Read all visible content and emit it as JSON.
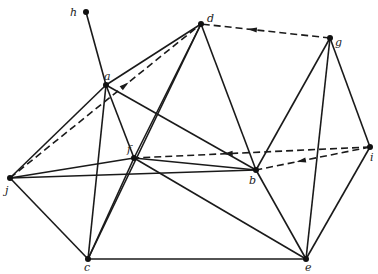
{
  "diagram": {
    "type": "graph",
    "nodes": [
      {
        "id": "h",
        "label": "h",
        "x": 86,
        "y": 12,
        "lx": 70,
        "ly": 16
      },
      {
        "id": "a",
        "label": "a",
        "x": 106,
        "y": 85,
        "lx": 104,
        "ly": 80
      },
      {
        "id": "d",
        "label": "d",
        "x": 201,
        "y": 24,
        "lx": 207,
        "ly": 22
      },
      {
        "id": "g",
        "label": "g",
        "x": 330,
        "y": 38,
        "lx": 335,
        "ly": 46
      },
      {
        "id": "f",
        "label": "f",
        "x": 134,
        "y": 158,
        "lx": 127,
        "ly": 153
      },
      {
        "id": "b",
        "label": "b",
        "x": 256,
        "y": 170,
        "lx": 249,
        "ly": 184
      },
      {
        "id": "i",
        "label": "i",
        "x": 370,
        "y": 147,
        "lx": 370,
        "ly": 161
      },
      {
        "id": "j",
        "label": "j",
        "x": 10,
        "y": 178,
        "lx": 5,
        "ly": 194
      },
      {
        "id": "c",
        "label": "c",
        "x": 88,
        "y": 259,
        "lx": 84,
        "ly": 271
      },
      {
        "id": "e",
        "label": "e",
        "x": 306,
        "y": 259,
        "lx": 305,
        "ly": 271
      }
    ],
    "edges": [
      {
        "from": "h",
        "to": "a"
      },
      {
        "from": "a",
        "to": "d"
      },
      {
        "from": "a",
        "to": "j"
      },
      {
        "from": "a",
        "to": "c"
      },
      {
        "from": "a",
        "to": "f"
      },
      {
        "from": "a",
        "to": "b"
      },
      {
        "from": "d",
        "to": "f"
      },
      {
        "from": "d",
        "to": "b"
      },
      {
        "from": "d",
        "to": "c"
      },
      {
        "from": "g",
        "to": "b"
      },
      {
        "from": "g",
        "to": "e"
      },
      {
        "from": "g",
        "to": "i"
      },
      {
        "from": "j",
        "to": "f"
      },
      {
        "from": "j",
        "to": "b"
      },
      {
        "from": "j",
        "to": "c"
      },
      {
        "from": "f",
        "to": "b"
      },
      {
        "from": "f",
        "to": "e"
      },
      {
        "from": "f",
        "to": "c"
      },
      {
        "from": "b",
        "to": "e"
      },
      {
        "from": "c",
        "to": "e"
      },
      {
        "from": "i",
        "to": "e"
      }
    ],
    "dashed_edges": [
      {
        "from": "j",
        "to": "d",
        "arrow_toward": "d"
      },
      {
        "from": "g",
        "to": "d",
        "arrow_toward": "d"
      },
      {
        "from": "i",
        "to": "f",
        "arrow_toward": "f"
      },
      {
        "from": "i",
        "to": "b",
        "arrow_toward": "b"
      }
    ]
  }
}
